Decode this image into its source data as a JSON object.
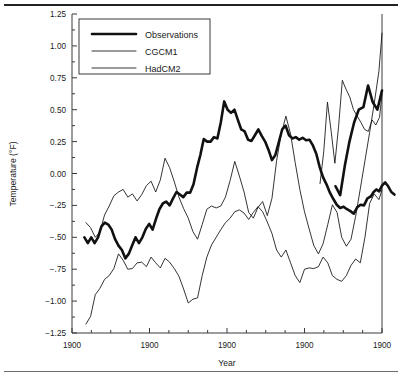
{
  "figure": {
    "top_rule": "horizontal-rule",
    "bottom_rule": "horizontal-rule"
  },
  "chart_data": {
    "type": "line",
    "title": "",
    "xlabel": "Year",
    "ylabel": "Temperature (°F)",
    "ylim": [
      -1.25,
      1.25
    ],
    "xlim": [
      0,
      100
    ],
    "grid": false,
    "legend_position": "upper-left-inside",
    "y_ticks": [
      1.25,
      1.0,
      0.75,
      0.5,
      0.25,
      0.0,
      -0.25,
      -0.5,
      -0.75,
      -1.0,
      -1.25
    ],
    "y_tick_labels": [
      "1.25",
      "1.00",
      "0.75",
      "0.50",
      "0.25",
      "0.00",
      "−.25",
      "−.50",
      "−.75",
      "−1.00",
      "−1.25"
    ],
    "x_ticks": [
      0,
      25,
      50,
      75,
      100
    ],
    "x_tick_labels": [
      "1900",
      "1900",
      "1900",
      "1900",
      "1900"
    ],
    "x_minor_ticks": [
      6.25,
      12.5,
      18.75,
      31.25,
      37.5,
      43.75,
      56.25,
      62.5,
      68.75,
      81.25,
      87.5,
      93.75
    ],
    "series": [
      {
        "name": "Observations",
        "style": "thick",
        "x": [
          4.0,
          5.1,
          6.2,
          7.3,
          8.4,
          9.5,
          10.6,
          11.7,
          12.8,
          13.9,
          15.0,
          16.1,
          17.2,
          18.3,
          19.4,
          20.5,
          21.6,
          22.7,
          23.8,
          24.9,
          26.0,
          27.1,
          28.2,
          29.3,
          30.4,
          31.5,
          32.6,
          33.7,
          34.8,
          35.9,
          37.0,
          38.1,
          39.2,
          40.3,
          41.4,
          42.5,
          43.6,
          44.7,
          45.8,
          46.9,
          48.0,
          49.1,
          50.2,
          51.3,
          52.4,
          53.5,
          54.6,
          55.7,
          56.8,
          57.9,
          59.0,
          60.1,
          61.2,
          62.3,
          63.4,
          64.5,
          65.6,
          66.7,
          67.8,
          68.9,
          70.0,
          71.1,
          72.2,
          73.3,
          74.4,
          75.5,
          76.6,
          77.7,
          78.8,
          79.9,
          81.0,
          82.1,
          83.2,
          84.3,
          85.4,
          86.5,
          87.6,
          88.7,
          89.8,
          90.9,
          92.0,
          93.1,
          94.2,
          95.3,
          96.4
        ],
        "y": [
          -0.5,
          -0.545,
          -0.5,
          -0.545,
          -0.5,
          -0.415,
          -0.385,
          -0.4,
          -0.44,
          -0.515,
          -0.565,
          -0.6,
          -0.665,
          -0.63,
          -0.565,
          -0.5,
          -0.545,
          -0.5,
          -0.435,
          -0.395,
          -0.44,
          -0.355,
          -0.28,
          -0.235,
          -0.22,
          -0.25,
          -0.195,
          -0.145,
          -0.165,
          -0.185,
          -0.15,
          -0.15,
          -0.085,
          0.04,
          0.145,
          0.27,
          0.25,
          0.25,
          0.285,
          0.275,
          0.4,
          0.565,
          0.5,
          0.475,
          0.5,
          0.42,
          0.345,
          0.33,
          0.265,
          0.255,
          0.3,
          0.345,
          0.295,
          0.25,
          0.185,
          0.105,
          0.145,
          0.245,
          0.345,
          0.375,
          0.3,
          0.275,
          0.285,
          0.265,
          0.28,
          0.26,
          0.265,
          0.22,
          0.155,
          0.05,
          -0.03,
          -0.085,
          -0.15,
          -0.2,
          -0.245,
          -0.27,
          -0.26,
          -0.28,
          -0.295,
          -0.315,
          -0.265,
          -0.245,
          -0.25,
          -0.195,
          -0.18
        ]
      },
      {
        "name": "Observations-tail",
        "style": "thick",
        "x": [
          96.4,
          97.3,
          98.2,
          99.1,
          100.0,
          101.0,
          102.0,
          103.0,
          104.0
        ],
        "y": [
          -0.18,
          -0.145,
          -0.125,
          -0.14,
          -0.095,
          -0.07,
          -0.1,
          -0.145,
          -0.165
        ]
      },
      {
        "name": "CGCM1",
        "style": "thin",
        "x": [
          4.5,
          6.0,
          7.5,
          9.0,
          10.5,
          12.0,
          13.5,
          15.0,
          16.5,
          18.0,
          19.5,
          21.0,
          22.5,
          24.0,
          25.5,
          27.0,
          28.5,
          30.0,
          31.5,
          33.0,
          34.5,
          36.0,
          37.5,
          39.0,
          40.5,
          42.0,
          43.5,
          45.0,
          46.5,
          48.0,
          49.5,
          51.0,
          52.5,
          54.0,
          55.5,
          57.0,
          58.5,
          60.0,
          61.5,
          63.0,
          64.5,
          66.0,
          67.5,
          69.0,
          70.5,
          72.0,
          73.5,
          75.0,
          76.5,
          78.0,
          79.5,
          81.0,
          82.5,
          84.0,
          85.5,
          87.0,
          88.5,
          90.0,
          91.5,
          93.0,
          94.5,
          96.0,
          97.5,
          99.0,
          100.0
        ],
        "y": [
          -0.385,
          -0.425,
          -0.5,
          -0.46,
          -0.325,
          -0.255,
          -0.175,
          -0.145,
          -0.125,
          -0.185,
          -0.16,
          -0.215,
          -0.165,
          -0.095,
          -0.06,
          -0.145,
          -0.05,
          0.12,
          0.045,
          -0.065,
          -0.185,
          -0.275,
          -0.35,
          -0.455,
          -0.515,
          -0.4,
          -0.28,
          -0.255,
          -0.27,
          -0.255,
          -0.185,
          -0.055,
          0.095,
          -0.02,
          -0.145,
          -0.305,
          -0.35,
          -0.265,
          -0.22,
          -0.33,
          -0.195,
          0.1,
          0.31,
          0.45,
          0.31,
          0.085,
          -0.125,
          -0.3,
          -0.435,
          -0.565,
          -0.63,
          -0.55,
          -0.4,
          -0.245,
          -0.305,
          -0.5,
          -0.57,
          -0.515,
          -0.335,
          -0.12,
          0.1,
          0.32,
          0.55,
          0.8,
          1.1
        ]
      },
      {
        "name": "HadCM2",
        "style": "thin",
        "x": [
          4.5,
          6.0,
          7.5,
          9.0,
          10.5,
          12.0,
          13.5,
          15.0,
          16.5,
          18.0,
          19.5,
          21.0,
          22.5,
          24.0,
          25.5,
          27.0,
          28.5,
          30.0,
          31.5,
          33.0,
          34.5,
          36.0,
          37.5,
          39.0,
          40.5,
          42.0,
          43.5,
          45.0,
          46.5,
          48.0,
          49.5,
          51.0,
          52.5,
          54.0,
          55.5,
          57.0,
          58.5,
          60.0,
          61.5,
          63.0,
          64.5,
          66.0,
          67.5,
          69.0,
          70.5,
          72.0,
          73.5,
          75.0,
          76.5,
          78.0,
          79.5,
          81.0,
          82.5,
          84.0,
          85.5,
          87.0,
          88.5,
          90.0,
          91.5,
          93.0,
          94.5,
          96.0,
          97.5,
          99.0,
          100.0
        ],
        "y": [
          -1.18,
          -1.12,
          -0.95,
          -0.9,
          -0.83,
          -0.8,
          -0.745,
          -0.63,
          -0.68,
          -0.75,
          -0.745,
          -0.7,
          -0.695,
          -0.73,
          -0.655,
          -0.7,
          -0.74,
          -0.665,
          -0.695,
          -0.745,
          -0.805,
          -0.905,
          -1.015,
          -0.985,
          -0.975,
          -0.8,
          -0.655,
          -0.56,
          -0.5,
          -0.44,
          -0.385,
          -0.35,
          -0.3,
          -0.285,
          -0.31,
          -0.36,
          -0.305,
          -0.26,
          -0.3,
          -0.38,
          -0.47,
          -0.6,
          -0.655,
          -0.6,
          -0.7,
          -0.8,
          -0.855,
          -0.75,
          -0.74,
          -0.745,
          -0.73,
          -0.655,
          -0.7,
          -0.8,
          -0.83,
          -0.845,
          -0.8,
          -0.72,
          -0.67,
          -0.7,
          -0.5,
          -0.235,
          -0.16,
          -0.205,
          -0.13
        ]
      },
      {
        "name": "CGCM1-late",
        "style": "thin",
        "x": [
          80.0,
          81.2,
          82.4,
          83.6,
          84.8,
          86.0,
          87.2,
          88.4,
          89.6,
          90.8,
          92.0,
          93.2,
          94.4,
          95.6,
          96.8,
          98.0,
          99.2,
          100.0
        ],
        "y": [
          -0.08,
          0.17,
          0.56,
          0.33,
          0.08,
          0.37,
          0.73,
          0.66,
          0.6,
          0.5,
          0.45,
          0.4,
          0.345,
          0.33,
          0.42,
          0.38,
          0.44,
          0.62
        ]
      },
      {
        "name": "Observations-late",
        "style": "thick",
        "x": [
          85.0,
          86.5,
          88.0,
          89.5,
          91.0,
          92.5,
          94.0,
          95.5,
          97.0,
          98.5,
          100.0
        ],
        "y": [
          -0.1,
          -0.17,
          0.06,
          0.25,
          0.4,
          0.5,
          0.52,
          0.69,
          0.56,
          0.5,
          0.65
        ]
      }
    ],
    "legend_entries": [
      {
        "label": "Observations",
        "style": "thick"
      },
      {
        "label": "CGCM1",
        "style": "thin"
      },
      {
        "label": "HadCM2",
        "style": "thin"
      }
    ]
  }
}
